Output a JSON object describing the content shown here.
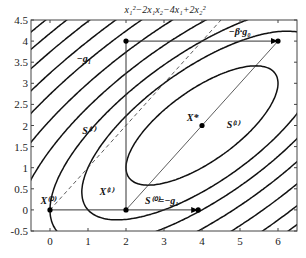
{
  "chart_data": {
    "type": "contour",
    "title": "x₁²−2x₁x₂−4x₁+2x₂²",
    "function": "x1^2 - 2*x1*x2 - 4*x1 + 2*x2^2",
    "xlabel": "",
    "ylabel": "",
    "xlim": [
      -0.5,
      6.5
    ],
    "ylim": [
      -0.5,
      4.5
    ],
    "xticks": [
      0,
      1,
      2,
      3,
      4,
      5,
      6
    ],
    "yticks": [
      -0.5,
      0,
      0.5,
      1,
      1.5,
      2,
      2.5,
      3,
      3.5,
      4,
      4.5
    ],
    "grid": false,
    "contour_levels": [
      -6,
      -3,
      0,
      4,
      9,
      15,
      21,
      28,
      35,
      42
    ],
    "points": [
      {
        "name": "X(0)",
        "label": "X⁽⁰⁾",
        "x": 0,
        "y": 0
      },
      {
        "name": "X(1)",
        "label": "X⁽¹⁾",
        "x": 2,
        "y": 0
      },
      {
        "name": "X*",
        "label": "X*",
        "x": 4,
        "y": 2
      },
      {
        "name": "grad-point-top-left",
        "x": 2,
        "y": 4
      },
      {
        "name": "grad-point-top-right",
        "x": 6,
        "y": 4
      },
      {
        "name": "grad-point-bottom",
        "x": 3.9,
        "y": 0
      }
    ],
    "segments": [
      {
        "name": "steepest-descent-x0-x1",
        "from": [
          0,
          0
        ],
        "to": [
          3.9,
          0
        ],
        "style": "solid"
      },
      {
        "name": "neg-g1-vertical",
        "from": [
          2,
          0
        ],
        "to": [
          2,
          4
        ],
        "style": "solid"
      },
      {
        "name": "beta-g0-horizontal",
        "from": [
          2,
          4
        ],
        "to": [
          6,
          4
        ],
        "style": "solid"
      },
      {
        "name": "conjugate-direction-s1",
        "from": [
          2,
          0
        ],
        "to": [
          6,
          4
        ],
        "style": "thin"
      },
      {
        "name": "parallel-s1-dashed",
        "from": [
          0,
          0
        ],
        "to": [
          4.5,
          4.5
        ],
        "style": "dashed"
      }
    ],
    "annotations": [
      {
        "text": "−g₁",
        "x": 0.7,
        "y": 3.5
      },
      {
        "text": "−β·g₀",
        "x": 4.7,
        "y": 4.15
      },
      {
        "text": "S⁽¹⁾",
        "x": 0.85,
        "y": 1.8
      },
      {
        "text": "S⁽¹⁾",
        "x": 4.65,
        "y": 1.95
      },
      {
        "text": "X*",
        "x": 3.6,
        "y": 2.1
      },
      {
        "text": "X⁽¹⁾",
        "x": 1.3,
        "y": 0.35
      },
      {
        "text": "X⁽⁰⁾",
        "x": -0.25,
        "y": 0.15
      },
      {
        "text": "S⁽⁰⁾=−g₁",
        "x": 2.5,
        "y": 0.15
      }
    ]
  }
}
